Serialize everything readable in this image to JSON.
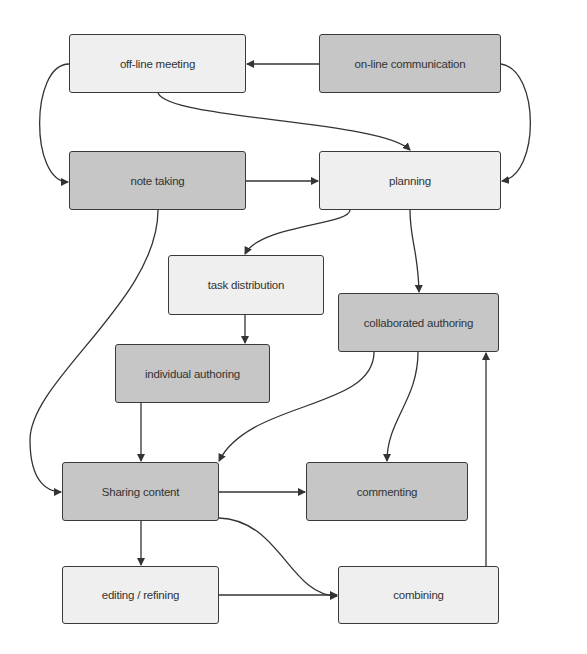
{
  "diagram": {
    "nodes": [
      {
        "id": "offline",
        "label": "off-line meeting",
        "shade": "light",
        "x": 69,
        "y": 34,
        "w": 177,
        "h": 59
      },
      {
        "id": "online",
        "label": "on-line communication",
        "shade": "dark",
        "x": 319,
        "y": 34,
        "w": 182,
        "h": 59
      },
      {
        "id": "note",
        "label": "note taking",
        "shade": "dark",
        "x": 69,
        "y": 151,
        "w": 177,
        "h": 59
      },
      {
        "id": "planning",
        "label": "planning",
        "shade": "light",
        "x": 319,
        "y": 151,
        "w": 182,
        "h": 59
      },
      {
        "id": "task",
        "label": "task distribution",
        "shade": "light",
        "x": 168,
        "y": 255,
        "w": 156,
        "h": 60
      },
      {
        "id": "collab",
        "label": "collaborated authoring",
        "shade": "dark",
        "x": 338,
        "y": 293,
        "w": 161,
        "h": 59
      },
      {
        "id": "indiv",
        "label": "individual authoring",
        "shade": "dark",
        "x": 115,
        "y": 344,
        "w": 155,
        "h": 59
      },
      {
        "id": "sharing",
        "label": "Sharing content",
        "shade": "dark",
        "x": 62,
        "y": 462,
        "w": 157,
        "h": 59
      },
      {
        "id": "commenting",
        "label": "commenting",
        "shade": "dark",
        "x": 306,
        "y": 462,
        "w": 162,
        "h": 59
      },
      {
        "id": "editing",
        "label": "editing / refining",
        "shade": "light",
        "x": 62,
        "y": 566,
        "w": 157,
        "h": 58
      },
      {
        "id": "combining",
        "label": "combining",
        "shade": "light",
        "x": 338,
        "y": 566,
        "w": 161,
        "h": 58
      }
    ],
    "edges": [
      {
        "from": "online",
        "to": "offline"
      },
      {
        "from": "offline",
        "to": "note"
      },
      {
        "from": "offline",
        "to": "planning"
      },
      {
        "from": "online",
        "to": "planning"
      },
      {
        "from": "note",
        "to": "planning"
      },
      {
        "from": "planning",
        "to": "task"
      },
      {
        "from": "planning",
        "to": "collab"
      },
      {
        "from": "task",
        "to": "indiv"
      },
      {
        "from": "note",
        "to": "sharing"
      },
      {
        "from": "indiv",
        "to": "sharing"
      },
      {
        "from": "collab",
        "to": "sharing"
      },
      {
        "from": "collab",
        "to": "commenting"
      },
      {
        "from": "sharing",
        "to": "commenting"
      },
      {
        "from": "sharing",
        "to": "editing"
      },
      {
        "from": "sharing",
        "to": "combining"
      },
      {
        "from": "editing",
        "to": "combining"
      },
      {
        "from": "combining",
        "to": "collab"
      }
    ],
    "colors": {
      "light": "#efefef",
      "dark": "#c6c6c6",
      "stroke": "#3a3a3a"
    }
  }
}
